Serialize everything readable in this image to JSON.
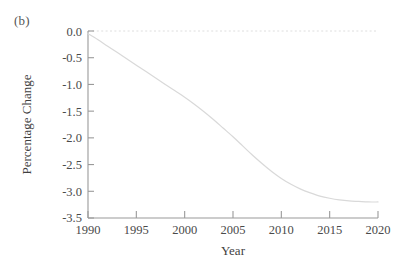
{
  "figure": {
    "panel_label": "(b)",
    "background_color": "#ffffff"
  },
  "chart_data": {
    "type": "line",
    "title": "",
    "subtitle": "",
    "panel_label": "(b)",
    "xlabel": "Year",
    "ylabel": "Percentage Change",
    "xlim": [
      1990,
      2020
    ],
    "ylim": [
      -3.5,
      0.0
    ],
    "xticks": [
      1990,
      1995,
      2000,
      2005,
      2010,
      2015,
      2020
    ],
    "xtick_labels": [
      "1990",
      "1995",
      "2000",
      "2005",
      "2010",
      "2015",
      "2020"
    ],
    "yticks": [
      0.0,
      -0.5,
      -1.0,
      -1.5,
      -2.0,
      -2.5,
      -3.0,
      -3.5
    ],
    "ytick_labels": [
      "0.0",
      "-0.5",
      "-1.0",
      "-1.5",
      "-2.0",
      "-2.5",
      "-3.0",
      "-3.5"
    ],
    "grid": false,
    "legend": null,
    "legend_position": "none",
    "tick_direction": "in",
    "line_color": "#d9d9d9",
    "line_width": 1.2,
    "reference_line": {
      "label": "zero-reference",
      "y": 0.0,
      "style": "dotted",
      "color": "#dedede"
    },
    "annotations": [],
    "x": [
      1990,
      1991,
      1992,
      1993,
      1994,
      1995,
      1996,
      1997,
      1998,
      1999,
      2000,
      2001,
      2002,
      2003,
      2004,
      2005,
      2006,
      2007,
      2008,
      2009,
      2010,
      2011,
      2012,
      2013,
      2014,
      2015,
      2016,
      2017,
      2018,
      2019,
      2020
    ],
    "values": [
      -0.05,
      -0.16,
      -0.28,
      -0.4,
      -0.52,
      -0.64,
      -0.76,
      -0.88,
      -1.0,
      -1.12,
      -1.24,
      -1.37,
      -1.51,
      -1.66,
      -1.82,
      -1.98,
      -2.15,
      -2.32,
      -2.48,
      -2.63,
      -2.76,
      -2.87,
      -2.96,
      -3.03,
      -3.09,
      -3.13,
      -3.16,
      -3.18,
      -3.19,
      -3.2,
      -3.2
    ],
    "series": [
      {
        "name": "Percentage Change",
        "color": "#d9d9d9",
        "values": [
          -0.05,
          -0.16,
          -0.28,
          -0.4,
          -0.52,
          -0.64,
          -0.76,
          -0.88,
          -1.0,
          -1.12,
          -1.24,
          -1.37,
          -1.51,
          -1.66,
          -1.82,
          -1.98,
          -2.15,
          -2.32,
          -2.48,
          -2.63,
          -2.76,
          -2.87,
          -2.96,
          -3.03,
          -3.09,
          -3.13,
          -3.16,
          -3.18,
          -3.19,
          -3.2,
          -3.2
        ]
      }
    ]
  },
  "axes_geometry": {
    "left": 88,
    "right": 378,
    "top": 31,
    "bottom": 218,
    "axis_color": "#9a9a9a"
  }
}
